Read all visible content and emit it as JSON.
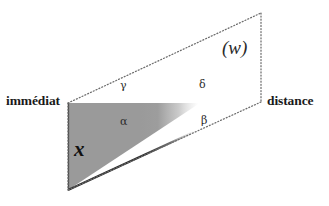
{
  "figure": {
    "background_color": "#ffffff",
    "width": 329,
    "height": 206,
    "shape": {
      "name": "parallelogram",
      "stroke_style": "dotted",
      "stroke_color": "#6b6b6b",
      "vertices": [
        {
          "name": "left",
          "x": 68,
          "y": 103
        },
        {
          "name": "top-right",
          "x": 261,
          "y": 13
        },
        {
          "name": "bottom-right",
          "x": 261,
          "y": 102
        },
        {
          "name": "bottom-left",
          "x": 68,
          "y": 190
        }
      ]
    },
    "shaded_region": {
      "name": "x-region",
      "fill_color": "#9a9a9a",
      "edge_color": "#2f2f2f",
      "fade": "gradient fading to white toward the right"
    },
    "labels": {
      "left_endpoint": "immédiat",
      "right_endpoint": "distance",
      "w": "(w)",
      "x": "x",
      "alpha": "α",
      "beta": "β",
      "gamma": "γ",
      "delta": "δ"
    }
  }
}
